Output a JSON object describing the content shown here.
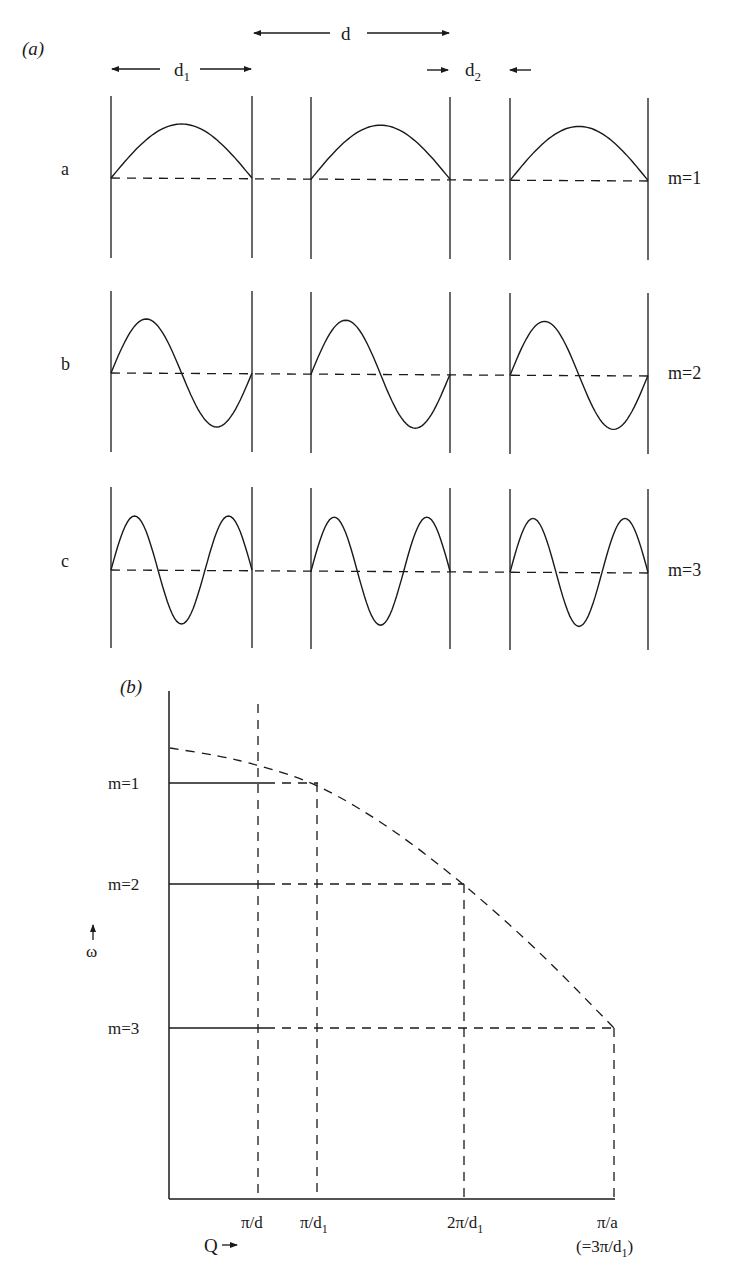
{
  "panel_a": {
    "label": "(a)",
    "dimensions": {
      "d": "d",
      "d1": "d",
      "d1_sub": "1",
      "d2": "d",
      "d2_sub": "2"
    },
    "cells_x": [
      [
        111,
        252
      ],
      [
        311,
        450
      ],
      [
        510,
        648
      ]
    ],
    "rows": [
      {
        "label": "a",
        "mode": "m=1",
        "m": 1,
        "top": 96,
        "bottom": 258,
        "baseline": 178,
        "amplitude": 54
      },
      {
        "label": "b",
        "mode": "m=2",
        "m": 2,
        "top": 291,
        "bottom": 452,
        "baseline": 373,
        "amplitude": 54
      },
      {
        "label": "c",
        "mode": "m=3",
        "m": 3,
        "top": 487,
        "bottom": 648,
        "baseline": 570,
        "amplitude": 54
      }
    ]
  },
  "panel_b": {
    "label": "(b)",
    "y_axis_label": "ω",
    "x_axis_label": "Q",
    "levels": [
      {
        "label": "m=1",
        "y": 783,
        "x_end": 318
      },
      {
        "label": "m=2",
        "y": 884,
        "x_end": 464
      },
      {
        "label": "m=3",
        "y": 1028,
        "x_end": 614
      }
    ],
    "x_ticks": [
      {
        "label": "π/d",
        "sub": "",
        "x": 258
      },
      {
        "label": "π/d",
        "sub": "1",
        "x": 317
      },
      {
        "label": "2π/d",
        "sub": "1",
        "x": 464
      },
      {
        "label": "π/a",
        "sub": "",
        "x": 614,
        "note": "(=3π/d",
        "note_sub": "1",
        "note_end": ")"
      }
    ],
    "dispersion_curve": [
      [
        170,
        748
      ],
      [
        220,
        756
      ],
      [
        258,
        765
      ],
      [
        318,
        784
      ],
      [
        390,
        827
      ],
      [
        464,
        884
      ],
      [
        540,
        952
      ],
      [
        614,
        1028
      ]
    ]
  },
  "chart_data": {
    "type": "line",
    "title": "",
    "xlabel": "Q",
    "ylabel": "ω",
    "x_ticks": [
      "π/d",
      "π/d1",
      "2π/d1",
      "π/a (=3π/d1)"
    ],
    "y_ticks": [
      "m=1",
      "m=2",
      "m=3"
    ],
    "series": [
      {
        "name": "dispersion (dashed)",
        "points": [
          [
            "0",
            "above m=1"
          ],
          [
            "π/d1",
            "m=1"
          ],
          [
            "2π/d1",
            "m=2"
          ],
          [
            "3π/d1",
            "m=3"
          ]
        ]
      }
    ],
    "panel_a_modes": [
      {
        "row": "a",
        "mode": "m=1",
        "half_wavelengths_per_cell": 1
      },
      {
        "row": "b",
        "mode": "m=2",
        "half_wavelengths_per_cell": 2
      },
      {
        "row": "c",
        "mode": "m=3",
        "half_wavelengths_per_cell": 3
      }
    ]
  }
}
